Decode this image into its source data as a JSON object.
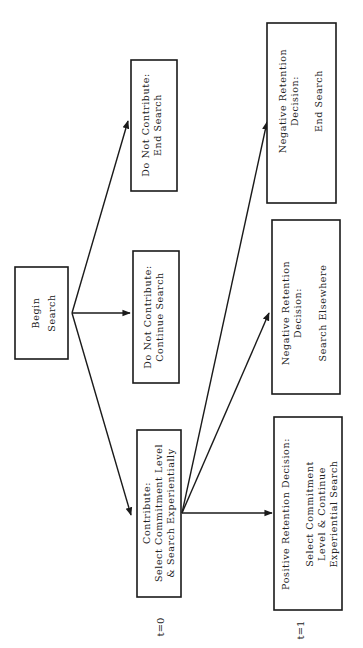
{
  "diagram": {
    "orientation": "rotated-90-ccw",
    "colors": {
      "line": "#1a1a1a",
      "text": "#222222",
      "background": "#ffffff"
    },
    "time_labels": {
      "t0": "t=0",
      "t1": "t=1"
    },
    "nodes": {
      "begin": {
        "lines": [
          "Begin",
          "Search"
        ]
      },
      "dnc_continue": {
        "lines": [
          "Do Not Contribute:",
          "Continue Search"
        ]
      },
      "dnc_end": {
        "lines": [
          "Do Not Contribute:",
          "End Search"
        ]
      },
      "contribute": {
        "lines": [
          "Contribute:",
          "Select Commitment Level",
          "& Search Experientially"
        ]
      },
      "pos_retention": {
        "lines": [
          "Positive Retention Decision:",
          "",
          "Select Commitment",
          "Level & Continue",
          "Experiential Search"
        ]
      },
      "neg_elsewhere": {
        "lines": [
          "Negative Retention",
          "Decision:",
          "",
          "Search Elsewhere"
        ]
      },
      "neg_end": {
        "lines": [
          "Negative Retention",
          "Decision:",
          "",
          "End Search"
        ]
      }
    },
    "edges": [
      {
        "from": "begin",
        "to": "contribute"
      },
      {
        "from": "begin",
        "to": "dnc_continue"
      },
      {
        "from": "begin",
        "to": "dnc_end"
      },
      {
        "from": "contribute",
        "to": "pos_retention"
      },
      {
        "from": "contribute",
        "to": "neg_elsewhere"
      },
      {
        "from": "contribute",
        "to": "neg_end"
      }
    ]
  }
}
